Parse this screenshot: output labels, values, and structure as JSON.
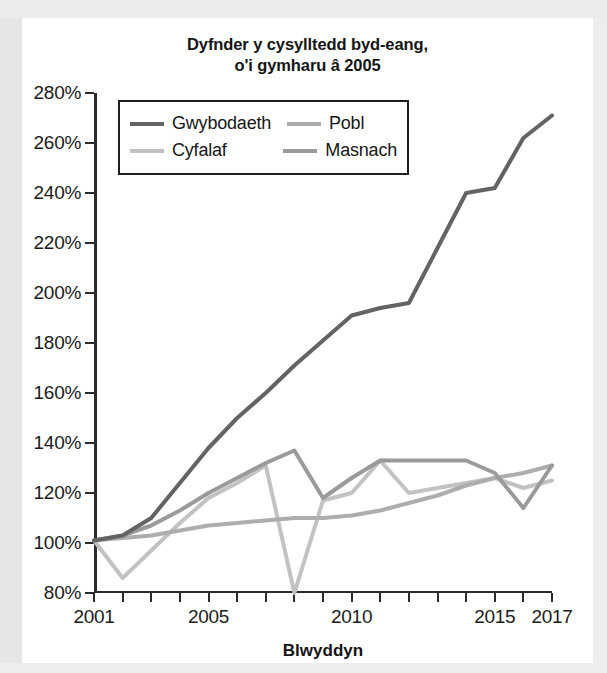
{
  "chart_data": {
    "type": "line",
    "title": "Dyfnder y cysylltedd byd-eang,\no'i gymharu â 2005",
    "xlabel": "Blwyddyn",
    "ylabel": "",
    "xlim": [
      2001,
      2017
    ],
    "ylim": [
      80,
      280
    ],
    "ytick_step": 20,
    "grid": false,
    "legend_position": "top-left-inside",
    "y_ticks": [
      280,
      260,
      240,
      220,
      200,
      180,
      160,
      140,
      120,
      100,
      80
    ],
    "y_tick_labels": [
      "280%",
      "260%",
      "240%",
      "220%",
      "200%",
      "180%",
      "160%",
      "140%",
      "120%",
      "100%",
      "80%"
    ],
    "x_ticks": [
      2001,
      2002,
      2003,
      2004,
      2005,
      2006,
      2007,
      2008,
      2009,
      2010,
      2011,
      2012,
      2013,
      2014,
      2015,
      2016,
      2017
    ],
    "x_tick_labels_shown": [
      {
        "x": 2001,
        "label": "2001"
      },
      {
        "x": 2005,
        "label": "2005"
      },
      {
        "x": 2010,
        "label": "2010"
      },
      {
        "x": 2015,
        "label": "2015"
      },
      {
        "x": 2017,
        "label": "2017"
      }
    ],
    "x": [
      2001,
      2002,
      2003,
      2004,
      2005,
      2006,
      2007,
      2008,
      2009,
      2010,
      2011,
      2012,
      2013,
      2014,
      2015,
      2016,
      2017
    ],
    "series": [
      {
        "name": "Gwybodaeth",
        "color": "#636363",
        "width": 4,
        "values": [
          101,
          103,
          110,
          124,
          138,
          150,
          160,
          171,
          181,
          191,
          194,
          196,
          218,
          240,
          242,
          262,
          271
        ]
      },
      {
        "name": "Pobl",
        "color": "#adadad",
        "width": 4,
        "values": [
          101,
          102,
          103,
          105,
          107,
          108,
          109,
          110,
          110,
          111,
          113,
          116,
          119,
          123,
          126,
          128,
          131
        ]
      },
      {
        "name": "Cyfalaf",
        "color": "#c2c2c2",
        "width": 4,
        "values": [
          101,
          86,
          97,
          108,
          118,
          124,
          131,
          80,
          117,
          120,
          133,
          120,
          122,
          124,
          126,
          122,
          125
        ]
      },
      {
        "name": "Masnach",
        "color": "#9a9a9a",
        "width": 4,
        "values": [
          101,
          103,
          107,
          113,
          120,
          126,
          132,
          137,
          118,
          126,
          133,
          133,
          133,
          133,
          128,
          114,
          131
        ]
      }
    ]
  },
  "legend": {
    "entries": [
      {
        "label": "Gwybodaeth",
        "color": "#636363"
      },
      {
        "label": "Pobl",
        "color": "#adadad"
      },
      {
        "label": "Cyfalaf",
        "color": "#c2c2c2"
      },
      {
        "label": "Masnach",
        "color": "#9a9a9a"
      }
    ]
  }
}
